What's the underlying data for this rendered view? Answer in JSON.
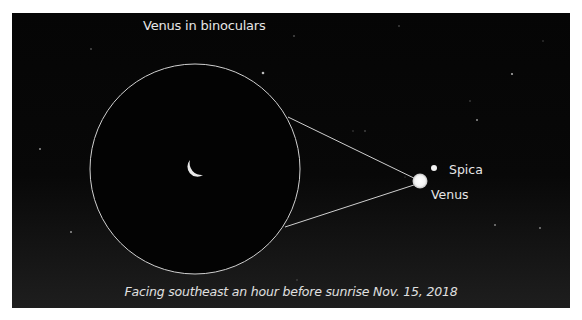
{
  "diagram": {
    "title": "Venus in binoculars",
    "caption": "Facing southeast an hour before sunrise Nov. 15, 2018",
    "objects": [
      {
        "name": "Spica",
        "label": "Spica"
      },
      {
        "name": "Venus",
        "label": "Venus"
      }
    ],
    "inset": {
      "description": "Binocular view circle showing crescent Venus"
    }
  },
  "colors": {
    "sky": "#050505",
    "sky_bottom": "#1e1e1e",
    "outline": "#d9d9d9",
    "text": "#e6e6e6",
    "page_background": "#ffffff"
  }
}
